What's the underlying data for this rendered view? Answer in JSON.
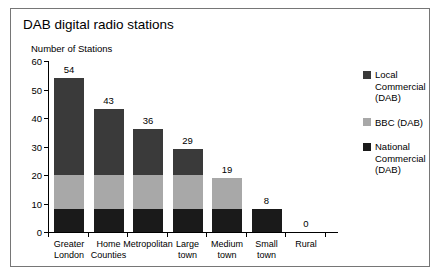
{
  "chart_data": {
    "type": "bar",
    "subtype": "stacked-vertical",
    "title": "DAB digital radio stations",
    "xlabel": "",
    "ylabel": "Number of Stations",
    "ylim": [
      0,
      60
    ],
    "yticks": [
      0,
      10,
      20,
      30,
      40,
      50,
      60
    ],
    "grid": false,
    "legend_position": "right",
    "categories": [
      "Greater London",
      "Home Counties",
      "Metropolitan",
      "Large town",
      "Medium town",
      "Small town",
      "Rural"
    ],
    "category_lines": [
      [
        "Greater",
        "London"
      ],
      [
        "Home",
        "Counties"
      ],
      [
        "Metropolitan",
        ""
      ],
      [
        "Large",
        "town"
      ],
      [
        "Medium",
        "town"
      ],
      [
        "Small",
        "town"
      ],
      [
        "Rural",
        ""
      ]
    ],
    "series": [
      {
        "name": "National Commercial (DAB)",
        "color": "#1a1a1a",
        "values": [
          8,
          8,
          8,
          8,
          8,
          8,
          0
        ]
      },
      {
        "name": "BBC (DAB)",
        "color": "#a8a8a8",
        "values": [
          12,
          12,
          12,
          12,
          11,
          0,
          0
        ]
      },
      {
        "name": "Local Commercial (DAB)",
        "color": "#3a3a3a",
        "values": [
          34,
          23,
          16,
          9,
          0,
          0,
          0
        ]
      }
    ],
    "totals": [
      54,
      43,
      36,
      29,
      19,
      8,
      0
    ],
    "total_labels": [
      "54",
      "43",
      "36",
      "29",
      "19",
      "8",
      "0"
    ]
  },
  "legend": {
    "items": [
      {
        "label_lines": [
          "Local",
          "Commercial",
          "(DAB)"
        ],
        "color": "#3a3a3a"
      },
      {
        "label_lines": [
          "BBC (DAB)"
        ],
        "color": "#a8a8a8"
      },
      {
        "label_lines": [
          "National",
          "Commercial",
          "(DAB)"
        ],
        "color": "#1a1a1a"
      }
    ]
  }
}
